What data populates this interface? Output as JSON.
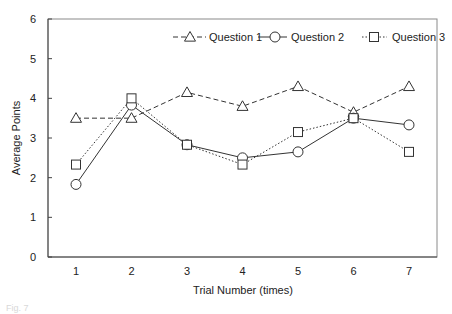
{
  "chart_data": {
    "type": "line",
    "title": "",
    "xlabel": "Trial Number (times)",
    "ylabel": "Average Points",
    "x": [
      1,
      2,
      3,
      4,
      5,
      6,
      7
    ],
    "categories": [
      "1",
      "2",
      "3",
      "4",
      "5",
      "6",
      "7"
    ],
    "yticks": [
      "0",
      "1",
      "2",
      "3",
      "4",
      "5",
      "6"
    ],
    "ylim": [
      0,
      6
    ],
    "grid": false,
    "legend_position": "top-right (inside)",
    "series": [
      {
        "name": "Question 1",
        "marker": "triangle",
        "line": "dashed",
        "values": [
          3.5,
          3.5,
          4.15,
          3.8,
          4.3,
          3.65,
          4.3
        ]
      },
      {
        "name": "Question 2",
        "marker": "circle",
        "line": "solid",
        "values": [
          1.83,
          3.83,
          2.83,
          2.5,
          2.65,
          3.5,
          3.33
        ]
      },
      {
        "name": "Question 3",
        "marker": "square",
        "line": "dotted",
        "values": [
          2.33,
          4.0,
          2.83,
          2.33,
          3.15,
          3.5,
          2.65
        ]
      }
    ]
  },
  "legend": {
    "items": [
      "Question 1",
      "Question 2",
      "Question 3"
    ]
  },
  "axes": {
    "xlabel": "Trial Number (times)",
    "ylabel": "Average Points"
  },
  "caption": "Fig. 7"
}
